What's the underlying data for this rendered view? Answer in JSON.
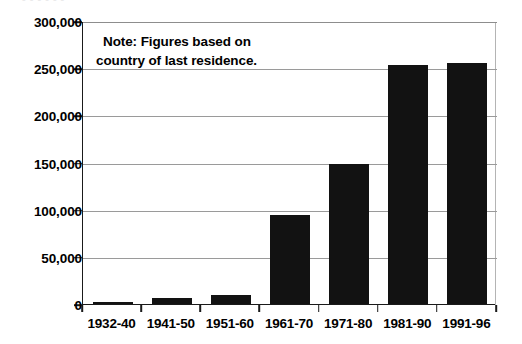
{
  "figure": {
    "ghost_caption": "- - - - - -"
  },
  "chart_data": {
    "type": "bar",
    "title": "",
    "subtitle": "",
    "xlabel": "",
    "ylabel": "",
    "categories": [
      "1932-40",
      "1941-50",
      "1951-60",
      "1961-70",
      "1971-80",
      "1981-90",
      "1991-96"
    ],
    "values": [
      2000,
      6000,
      10000,
      94000,
      148000,
      253000,
      256000
    ],
    "series": [
      {
        "name": "Immigration",
        "values": [
          2000,
          6000,
          10000,
          94000,
          148000,
          253000,
          256000
        ]
      }
    ],
    "ylim": [
      0,
      300000
    ],
    "ytick_values": [
      0,
      50000,
      100000,
      150000,
      200000,
      250000,
      300000
    ],
    "ytick_labels": [
      "0",
      "50,000",
      "100,000",
      "150,000",
      "200,000",
      "250,000",
      "300,000"
    ],
    "grid": true,
    "grid_axis": "y",
    "legend": false,
    "legend_position": "none",
    "bar_color": "#121212",
    "grid_color": "#9a9a9a",
    "axis_color": "#1a1a1a",
    "background_color": "#ffffff",
    "annotations": [
      {
        "name": "note",
        "line_1": "Note: Figures based on",
        "line_2": "country of last residence."
      }
    ]
  }
}
